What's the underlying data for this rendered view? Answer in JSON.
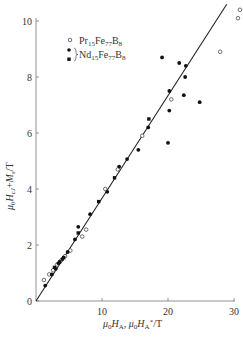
{
  "chart_data": {
    "type": "scatter",
    "title": "",
    "xlabel": "μ₀H_A, μ₀H_A*/T",
    "ylabel": "μ₀H_cJ + M_s /T",
    "xlim": [
      0,
      30
    ],
    "ylim": [
      0,
      10
    ],
    "xticks": [
      0,
      10,
      20,
      30
    ],
    "yticks": [
      0,
      2,
      4,
      6,
      8,
      10
    ],
    "grid": false,
    "legend_position": "upper-left",
    "legend": [
      {
        "marker": "open-circle",
        "label": "Pr15Fe77B8"
      },
      {
        "marker": "filled-circle",
        "label": "Nd15Fe77B8"
      },
      {
        "marker": "filled-square",
        "label": "Nd15Fe77B8"
      }
    ],
    "fit_line": {
      "x": [
        0,
        28.9
      ],
      "y": [
        0,
        10.6
      ],
      "color": "#222222"
    },
    "series": [
      {
        "name": "Pr15Fe77B8",
        "marker": "open-circle",
        "points": [
          [
            1.2,
            0.75
          ],
          [
            2.0,
            0.95
          ],
          [
            2.6,
            1.1
          ],
          [
            3.2,
            1.3
          ],
          [
            3.8,
            1.45
          ],
          [
            4.4,
            1.6
          ],
          [
            5.2,
            1.8
          ],
          [
            7.0,
            2.3
          ],
          [
            7.6,
            2.55
          ],
          [
            10.5,
            4.0
          ],
          [
            12.4,
            4.7
          ],
          [
            16.1,
            5.9
          ],
          [
            20.5,
            7.2
          ],
          [
            27.9,
            8.9
          ],
          [
            30.6,
            10.1
          ],
          [
            30.9,
            10.4
          ]
        ]
      },
      {
        "name": "Nd15Fe77B8 (circle)",
        "marker": "filled-circle",
        "points": [
          [
            1.4,
            0.55
          ],
          [
            2.4,
            0.95
          ],
          [
            3.0,
            1.15
          ],
          [
            3.4,
            1.35
          ],
          [
            4.0,
            1.5
          ],
          [
            4.8,
            1.75
          ],
          [
            5.9,
            2.2
          ],
          [
            6.4,
            2.65
          ],
          [
            8.2,
            3.1
          ],
          [
            10.8,
            3.9
          ],
          [
            12.6,
            4.8
          ],
          [
            13.8,
            5.07
          ],
          [
            15.5,
            5.4
          ],
          [
            17.0,
            6.2
          ],
          [
            20.0,
            5.65
          ],
          [
            20.2,
            6.8
          ],
          [
            20.2,
            7.5
          ],
          [
            22.4,
            7.35
          ],
          [
            22.6,
            8.0
          ],
          [
            22.7,
            8.4
          ],
          [
            21.7,
            8.5
          ],
          [
            19.1,
            8.7
          ],
          [
            24.8,
            7.1
          ]
        ]
      },
      {
        "name": "Nd15Fe77B8 (square)",
        "marker": "filled-square",
        "points": [
          [
            2.8,
            1.2
          ],
          [
            3.6,
            1.4
          ],
          [
            4.2,
            1.55
          ],
          [
            6.4,
            2.43
          ],
          [
            9.5,
            3.55
          ],
          [
            11.9,
            4.4
          ],
          [
            17.1,
            6.5
          ]
        ]
      }
    ]
  },
  "legend_labels": {
    "pr": {
      "base1": "Pr",
      "sub1": "15",
      "base2": "Fe",
      "sub2": "77",
      "base3": "B",
      "sub3": "8"
    },
    "nd": {
      "base1": "Nd",
      "sub1": "15",
      "base2": "Fe",
      "sub2": "77",
      "base3": "B",
      "sub3": "8"
    }
  },
  "axis_labels": {
    "x": {
      "mu": "μ",
      "sub0": "0",
      "H": "H",
      "subA": "A",
      "sep": ", ",
      "mu2": "μ",
      "sub02": "0",
      "H2": "H",
      "subA2": "A",
      "star": "*",
      "unit": "/T"
    },
    "y": {
      "mu": "μ",
      "sub0": "0",
      "H": "H",
      "subcJ": "cJ",
      "plus": "+",
      "M": "M",
      "subs": "s",
      "unit": "/T"
    }
  }
}
